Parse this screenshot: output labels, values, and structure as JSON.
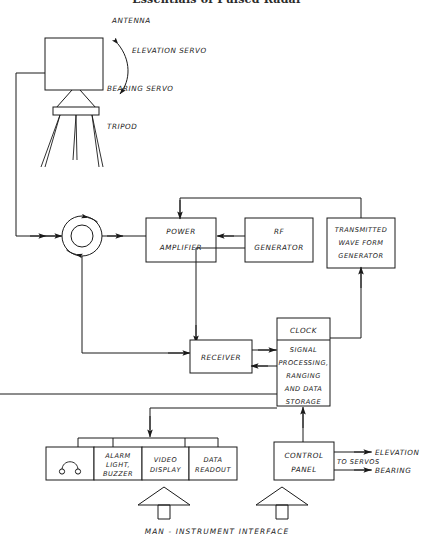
{
  "title": "Essentials of Pulsed Radar",
  "diagram": {
    "caption": "MAN - INSTRUMENT INTERFACE",
    "annotations": {
      "antenna": "ANTENNA",
      "elevation_servo": "ELEVATION SERVO",
      "bearing_servo": "BEARING SERVO",
      "tripod": "TRIPOD",
      "to_servos": "TO SERVOS",
      "elevation_out": "ELEVATION",
      "bearing_out": "BEARING"
    },
    "blocks": {
      "power_amplifier": {
        "line1": "POWER",
        "line2": "AMPLIFIER"
      },
      "rf_generator": {
        "line1": "RF",
        "line2": "GENERATOR"
      },
      "transmitted_wave_form_generator": {
        "line1": "TRANSMITTED",
        "line2": "WAVE FORM",
        "line3": "GENERATOR"
      },
      "receiver": {
        "line1": "RECEIVER"
      },
      "clock": {
        "line1": "CLOCK"
      },
      "signal_processing": {
        "line1": "SIGNAL",
        "line2": "PROCESSING,",
        "line3": "RANGING",
        "line4": "AND DATA",
        "line5": "STORAGE"
      },
      "control_panel": {
        "line1": "CONTROL",
        "line2": "PANEL"
      }
    },
    "display_group": [
      {
        "name": "headphones",
        "line1": "",
        "line2": "",
        "line3": ""
      },
      {
        "name": "alarm",
        "line1": "ALARM",
        "line2": "LIGHT,",
        "line3": "BUZZER"
      },
      {
        "name": "video-display",
        "line1": "VIDEO",
        "line2": "DISPLAY",
        "line3": ""
      },
      {
        "name": "data-readout",
        "line1": "DATA",
        "line2": "READOUT",
        "line3": ""
      }
    ],
    "colors": {
      "ink": "#1a1a1a",
      "paper": "#ffffff",
      "title": "#2b2b2b"
    }
  }
}
